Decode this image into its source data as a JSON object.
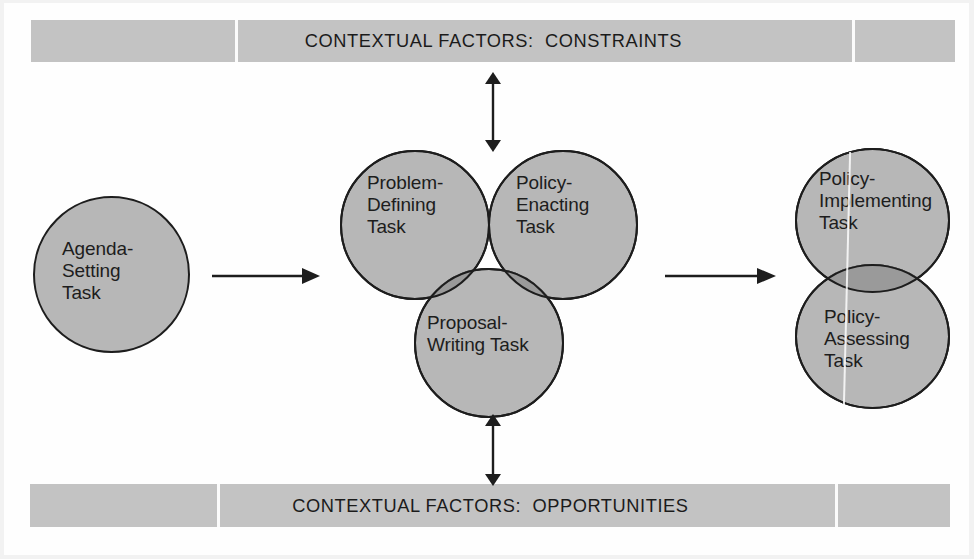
{
  "diagram": {
    "colors": {
      "background": "#fefefe",
      "banner_fill": "#c3c3c3",
      "circle_fill": "#b7b7b7",
      "overlap_fill": "#9a9a9a",
      "stroke": "#1d1d1d",
      "text": "#1d1d1d"
    },
    "banners": {
      "top": {
        "label": "CONTEXTUAL FACTORS:  CONSTRAINTS",
        "name": "contextual-factors-constraints"
      },
      "bottom": {
        "label": "CONTEXTUAL FACTORS:  OPPORTUNITIES",
        "name": "contextual-factors-opportunities"
      }
    },
    "stages": [
      {
        "id": "agenda-setting",
        "label": "Agenda-\nSetting\nTask"
      },
      {
        "id": "problem-defining",
        "label": "Problem-\nDefining\nTask"
      },
      {
        "id": "policy-enacting",
        "label": "Policy-\nEnacting\nTask"
      },
      {
        "id": "proposal-writing",
        "label": "Proposal-\nWriting Task"
      },
      {
        "id": "policy-implementing",
        "label": "Policy-\nImplementing\nTask"
      },
      {
        "id": "policy-assessing",
        "label": "Policy-\nAssessing\nTask"
      }
    ],
    "connectors": [
      {
        "id": "agenda-to-core",
        "kind": "arrow-right"
      },
      {
        "id": "core-to-implementation",
        "kind": "arrow-right"
      },
      {
        "id": "constraints-link",
        "kind": "arrow-double-vertical"
      },
      {
        "id": "opportunities-link",
        "kind": "arrow-double-vertical"
      }
    ]
  }
}
